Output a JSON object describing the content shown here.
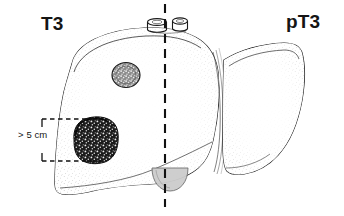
{
  "figure": {
    "labels": {
      "left_stage": "T3",
      "right_stage": "pT3",
      "size_annotation": "> 5 cm"
    },
    "colors": {
      "outline": "#1a1a1a",
      "stipple": "#9a9a9a",
      "tumor_large_fill": "#1f1f1f",
      "tumor_small_fill": "#6f6f6f",
      "gallbladder_fill": "#c9c9c9",
      "dashed_line": "#111111",
      "background": "#ffffff"
    },
    "parts": {
      "left_lobe": "left-hepatic-lobe",
      "right_lobe": "right-hepatic-lobe",
      "midline": "midline-dashed-axis",
      "vessel_stumps": "hepatic-vessel-stumps",
      "gallbladder": "gallbladder",
      "fissure": "interlobar-fissure",
      "tumor_large": "large-tumor-over-5cm",
      "tumor_small": "small-satellite-tumor",
      "measure_bracket": "size-measurement-bracket"
    }
  }
}
